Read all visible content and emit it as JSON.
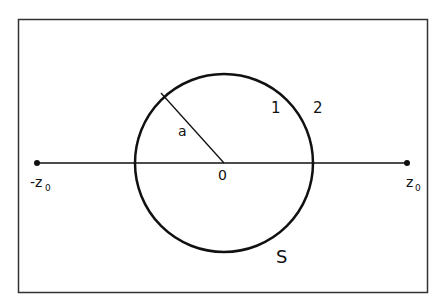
{
  "diagram": {
    "labels": {
      "left_point": "-z",
      "left_point_sub": "0",
      "right_point": "z",
      "right_point_sub": "0",
      "radius": "a",
      "center": "0",
      "region_inner": "1",
      "region_outer": "2",
      "surface": "S"
    },
    "colors": {
      "stroke": "#111111",
      "frame": "#333333",
      "background": "#ffffff"
    }
  }
}
